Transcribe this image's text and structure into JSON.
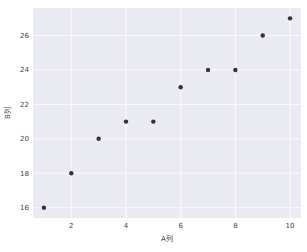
{
  "chart_data": {
    "type": "scatter",
    "title": "",
    "xlabel": "A列",
    "ylabel": "B列",
    "x": [
      1,
      2,
      3,
      4,
      5,
      6,
      7,
      8,
      9,
      10
    ],
    "y": [
      16,
      18,
      20,
      21,
      21,
      23,
      24,
      24,
      26,
      27
    ],
    "xticks": [
      2,
      4,
      6,
      8,
      10
    ],
    "yticks": [
      16,
      18,
      20,
      22,
      24,
      26
    ],
    "xlim": [
      0.6,
      10.4
    ],
    "ylim": [
      15.4,
      27.6
    ],
    "grid": true,
    "legend": null,
    "colors": {
      "background": "#eaeaf2",
      "grid": "#ffffff",
      "marker": "#333333"
    }
  }
}
